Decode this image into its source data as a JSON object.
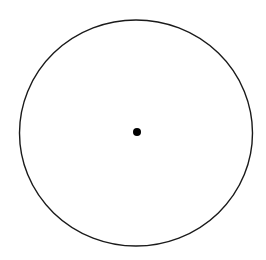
{
  "diagram": {
    "background": "#ffffff",
    "stroke_color": "#1a1a1a",
    "fill_color": "#000000",
    "circle": {
      "cx": 136,
      "cy": 133,
      "rx": 116.5,
      "ry": 113,
      "stroke_width": 1.4
    },
    "center_point": {
      "cx": 137,
      "cy": 132,
      "r": 4
    }
  }
}
